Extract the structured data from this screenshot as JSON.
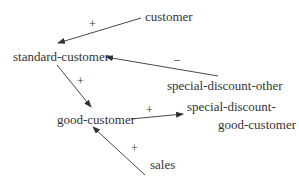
{
  "diagram": {
    "nodes": [
      {
        "id": "customer",
        "label": "customer"
      },
      {
        "id": "standard-customer",
        "label": "standard-customer"
      },
      {
        "id": "special-discount-other",
        "label": "special-discount-other"
      },
      {
        "id": "good-customer",
        "label": "good-customer"
      },
      {
        "id": "special-discount-good-customer",
        "label_line1": "special-discount-",
        "label_line2": "good-customer"
      },
      {
        "id": "sales",
        "label": "sales"
      }
    ],
    "edges": [
      {
        "from": "customer",
        "to": "standard-customer",
        "sign": "+"
      },
      {
        "from": "special-discount-other",
        "to": "standard-customer",
        "sign": "–"
      },
      {
        "from": "standard-customer",
        "to": "good-customer",
        "sign": "+"
      },
      {
        "from": "good-customer",
        "to": "special-discount-good-customer",
        "sign": "+"
      },
      {
        "from": "sales",
        "to": "good-customer",
        "sign": "+"
      }
    ]
  }
}
